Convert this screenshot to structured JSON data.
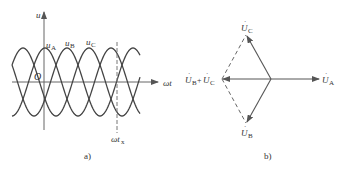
{
  "figure_a": {
    "caption": "a)",
    "y_axis_label": "u",
    "x_axis_label": "ωt",
    "origin_label": "O",
    "marker_label": "ωt",
    "marker_sub": "x",
    "curves": [
      {
        "name": "u",
        "sub": "A"
      },
      {
        "name": "u",
        "sub": "B"
      },
      {
        "name": "u",
        "sub": "C"
      }
    ]
  },
  "figure_b": {
    "caption": "b)",
    "phasors": {
      "A": {
        "name": "U",
        "sub": "A"
      },
      "B": {
        "name": "U",
        "sub": "B"
      },
      "C": {
        "name": "U",
        "sub": "C"
      }
    },
    "sum": {
      "name1": "U",
      "sub1": "B",
      "plus": "+",
      "name2": "U",
      "sub2": "C"
    },
    "dot": "·"
  },
  "colors": {
    "stroke": "#555555",
    "curve": "#444444",
    "text": "#333333"
  }
}
